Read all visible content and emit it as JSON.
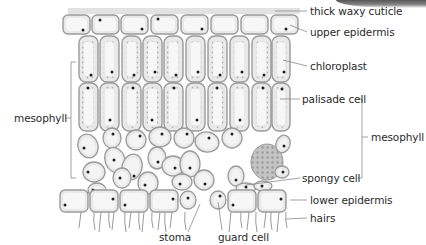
{
  "diagram": {
    "colors": {
      "cell_fill": "#e9e9e9",
      "cell_border": "#9a9a9a",
      "cell_inner": "#f7f7f7",
      "nucleus": "#222222",
      "cuticle": "#dcdcdc",
      "leader_line": "#8a8a8a",
      "label_text": "#2a2a2a",
      "air_space_cluster": "#b9b9b9"
    },
    "labels": {
      "cuticle": "thick waxy cuticle",
      "upper_epidermis": "upper epidermis",
      "chloroplast": "chloroplast",
      "palisade_cell": "palisade cell",
      "mesophyll_right": "mesophyll",
      "spongy_cell": "spongy cell",
      "lower_epidermis": "lower epidermis",
      "hairs": "hairs",
      "stoma": "stoma",
      "guard_cell": "guard cell",
      "mesophyll_left": "mesophyll"
    },
    "layers": [
      {
        "name": "thick waxy cuticle"
      },
      {
        "name": "upper epidermis",
        "cell_count": 8
      },
      {
        "name": "palisade mesophyll",
        "rows": 2,
        "cells_per_row": 9
      },
      {
        "name": "spongy mesophyll"
      },
      {
        "name": "lower epidermis",
        "cell_count": 8
      },
      {
        "name": "hairs"
      }
    ]
  }
}
